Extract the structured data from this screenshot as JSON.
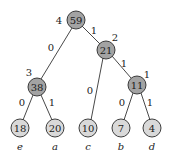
{
  "diagram": {
    "type": "huffman-tree",
    "nodes": {
      "root": {
        "value": "59",
        "x": 76,
        "y": 20,
        "kind": "internal",
        "side_label": "4"
      },
      "n21": {
        "value": "21",
        "x": 106,
        "y": 50,
        "kind": "internal",
        "side_label": "2"
      },
      "n38": {
        "value": "38",
        "x": 37,
        "y": 87,
        "kind": "internal",
        "side_label": "3"
      },
      "n11": {
        "value": "11",
        "x": 137,
        "y": 85,
        "kind": "internal",
        "side_label": "1"
      },
      "leaf_e": {
        "value": "18",
        "x": 20,
        "y": 128,
        "kind": "leaf",
        "symbol": "e"
      },
      "leaf_a": {
        "value": "20",
        "x": 55,
        "y": 128,
        "kind": "leaf",
        "symbol": "a"
      },
      "leaf_c": {
        "value": "10",
        "x": 88,
        "y": 128,
        "kind": "leaf",
        "symbol": "c"
      },
      "leaf_b": {
        "value": "7",
        "x": 121,
        "y": 128,
        "kind": "leaf",
        "symbol": "b"
      },
      "leaf_d": {
        "value": "4",
        "x": 152,
        "y": 128,
        "kind": "leaf",
        "symbol": "d"
      }
    },
    "edges": {
      "root_n38": {
        "label": "0"
      },
      "root_n21": {
        "label": "1"
      },
      "n21_c": {
        "label": "0"
      },
      "n21_n11": {
        "label": "1"
      },
      "n38_e": {
        "label": "0"
      },
      "n38_a": {
        "label": "1"
      },
      "n11_b": {
        "label": "0"
      },
      "n11_d": {
        "label": "1"
      }
    },
    "colors": {
      "internal_fill": "#a3a3a3",
      "leaf_fill": "#d9d9d9",
      "stroke": "#2a2a2a"
    }
  }
}
